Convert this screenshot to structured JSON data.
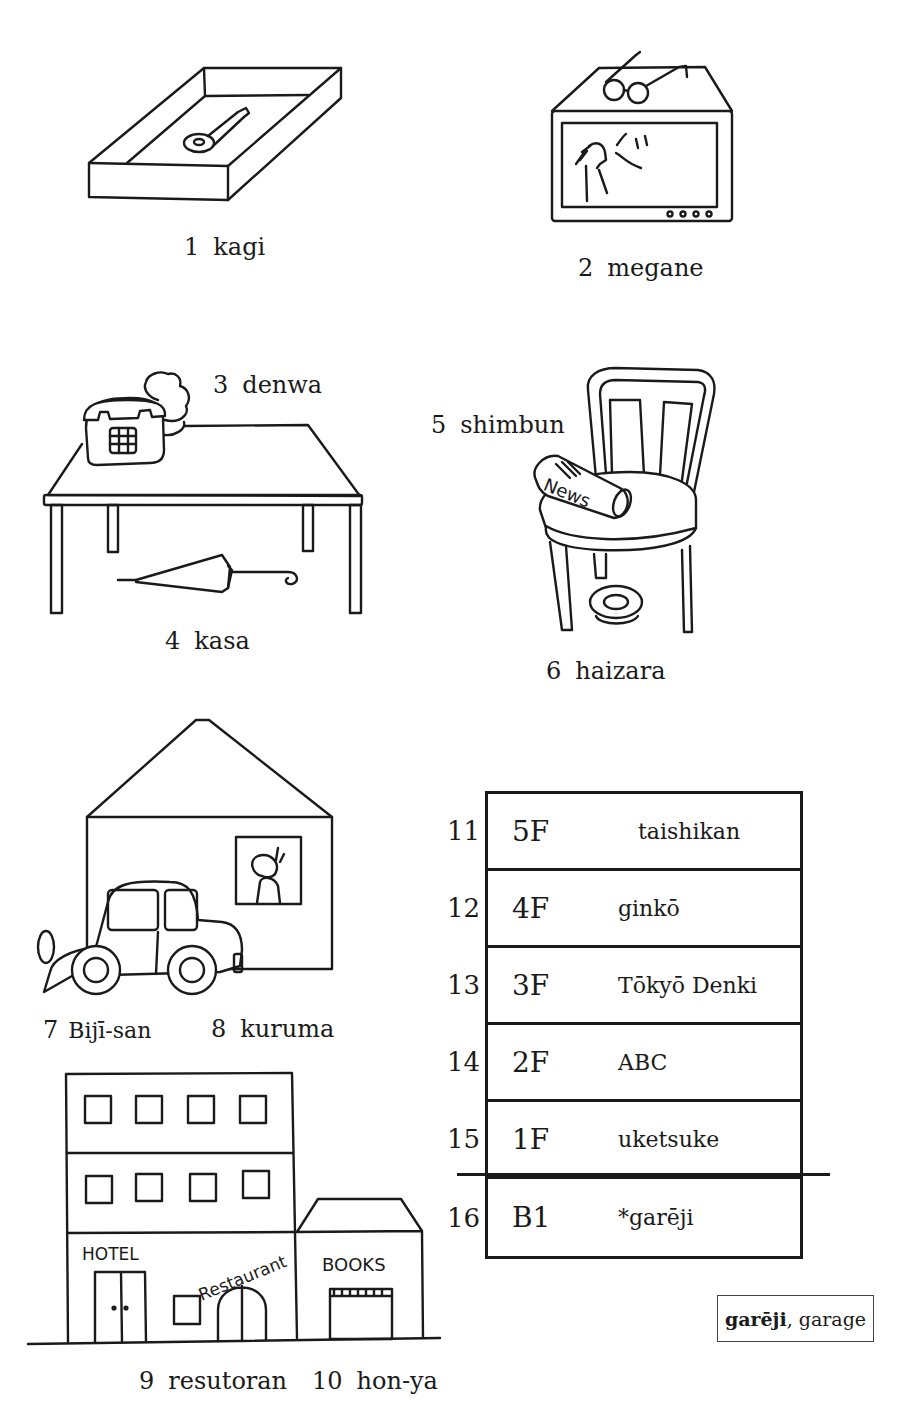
{
  "page": {
    "type": "vocabulary illustration page"
  },
  "items": [
    {
      "num": "1",
      "word": "kagi",
      "depicts": "key in tray"
    },
    {
      "num": "2",
      "word": "megane",
      "depicts": "glasses on television"
    },
    {
      "num": "3",
      "word": "denwa",
      "depicts": "telephone on table"
    },
    {
      "num": "4",
      "word": "kasa",
      "depicts": "umbrella under table"
    },
    {
      "num": "5",
      "word": "shimbun",
      "depicts": "newspaper on chair"
    },
    {
      "num": "6",
      "word": "haizara",
      "depicts": "ashtray under chair"
    },
    {
      "num": "7",
      "word": "Bijī-san",
      "depicts": "person in house window"
    },
    {
      "num": "8",
      "word": "kuruma",
      "depicts": "car in front of house"
    },
    {
      "num": "9",
      "word": "resutoran",
      "depicts": "restaurant in hotel building"
    },
    {
      "num": "10",
      "word": "hon-ya",
      "depicts": "bookstore"
    }
  ],
  "illustration_text": {
    "newspaper": "News",
    "hotel_sign": "HOTEL",
    "restaurant_sign": "Restaurant",
    "books_sign": "BOOKS"
  },
  "directory": {
    "rows": [
      {
        "num": "11",
        "floor": "5F",
        "name": "taishikan"
      },
      {
        "num": "12",
        "floor": "4F",
        "name": "ginkō"
      },
      {
        "num": "13",
        "floor": "3F",
        "name": "Tōkyō Denki"
      },
      {
        "num": "14",
        "floor": "2F",
        "name": "ABC"
      },
      {
        "num": "15",
        "floor": "1F",
        "name": "uketsuke"
      },
      {
        "num": "16",
        "floor": "B1",
        "name": "*garēji"
      }
    ]
  },
  "gloss": {
    "term": "garēji",
    "separator": ", ",
    "meaning": "garage"
  }
}
